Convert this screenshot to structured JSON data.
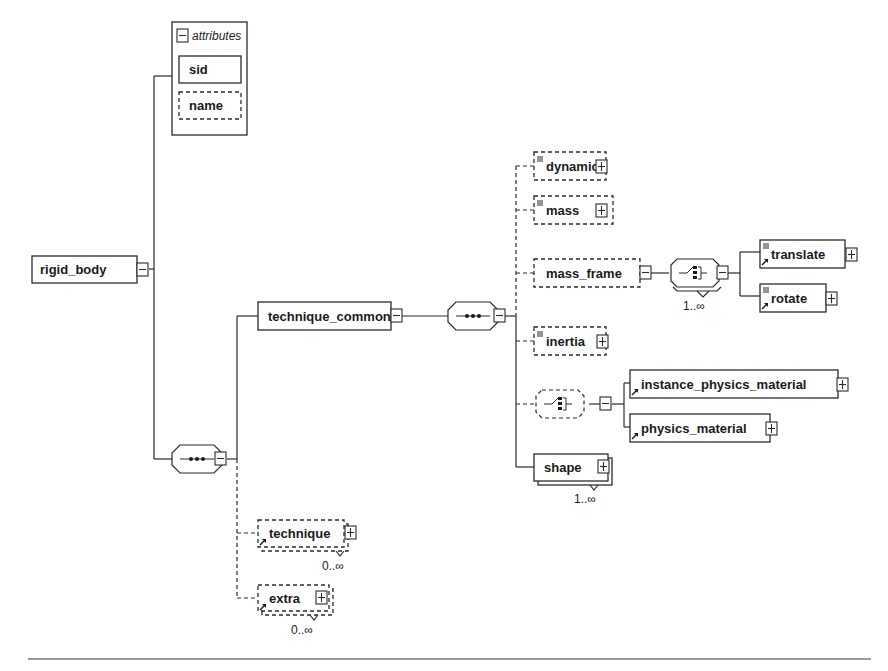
{
  "diagram": {
    "type": "XML schema element diagram",
    "root": {
      "label": "rigid_body",
      "expander": "minus"
    },
    "attributes": {
      "header": "attributes",
      "items": [
        {
          "label": "sid",
          "optional": false
        },
        {
          "label": "name",
          "optional": true
        }
      ]
    },
    "sequence_root": {
      "kind": "sequence",
      "expander": "minus"
    },
    "technique_common": {
      "label": "technique_common",
      "expander": "minus",
      "sequence": {
        "kind": "sequence",
        "expander": "minus"
      },
      "children": {
        "dynamic": {
          "label": "dynamic",
          "optional": true,
          "expander": "plus"
        },
        "mass": {
          "label": "mass",
          "optional": true,
          "expander": "plus"
        },
        "mass_frame": {
          "label": "mass_frame",
          "optional": true,
          "expander": "minus",
          "choice": {
            "kind": "choice",
            "cardinality": "1..∞"
          },
          "children": {
            "translate": {
              "label": "translate",
              "expander": "plus"
            },
            "rotate": {
              "label": "rotate",
              "expander": "plus"
            }
          }
        },
        "inertia": {
          "label": "inertia",
          "optional": true,
          "expander": "plus"
        },
        "material_choice": {
          "kind": "choice",
          "optional": true,
          "expander": "minus",
          "children": {
            "instance_physics_material": {
              "label": "instance_physics_material",
              "expander": "plus"
            },
            "physics_material": {
              "label": "physics_material",
              "expander": "plus"
            }
          }
        },
        "shape": {
          "label": "shape",
          "cardinality": "1..∞",
          "expander": "plus"
        }
      }
    },
    "technique": {
      "label": "technique",
      "optional": true,
      "cardinality": "0..∞",
      "expander": "plus"
    },
    "extra": {
      "label": "extra",
      "optional": true,
      "cardinality": "0..∞",
      "expander": "plus"
    }
  }
}
